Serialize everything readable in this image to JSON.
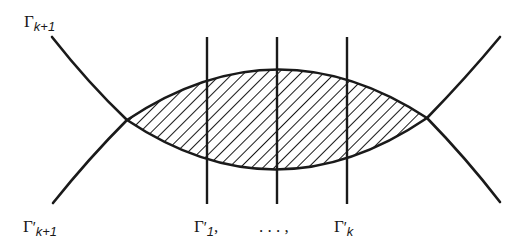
{
  "diagram": {
    "labels": {
      "top_left": {
        "base": "Γ",
        "prime": "",
        "sub": "k+1"
      },
      "bottom_left": {
        "base": "Γ",
        "prime": "′",
        "sub": "k+1"
      },
      "bottom_v1": {
        "base": "Γ",
        "prime": "′",
        "sub": "1",
        "suffix": ","
      },
      "bottom_dots": {
        "text": ". . . ,"
      },
      "bottom_vk": {
        "base": "Γ",
        "prime": "′",
        "sub": "k"
      }
    },
    "stroke_color": "#1a1a1a",
    "background_color": "#ffffff"
  }
}
